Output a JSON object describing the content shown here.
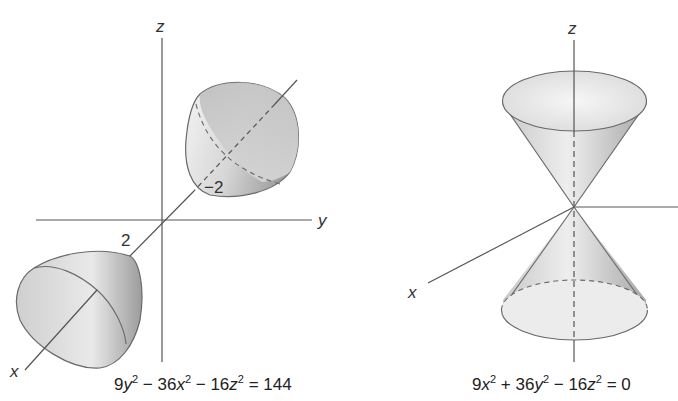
{
  "figures": [
    {
      "id": "hyperboloid-two-sheets",
      "axis_labels": {
        "x": "x",
        "y": "y",
        "z": "z"
      },
      "tick_labels": {
        "positive_x": "2",
        "negative_x": "−2"
      },
      "equation": {
        "parts": [
          "9",
          "y",
          "2",
          " − 36",
          "x",
          "2",
          " − 16",
          "z",
          "2",
          " = 144"
        ]
      }
    },
    {
      "id": "elliptic-cone",
      "axis_labels": {
        "x": "x",
        "z": "z"
      },
      "equation": {
        "parts": [
          "9",
          "x",
          "2",
          " + 36",
          "y",
          "2",
          " − 16",
          "z",
          "2",
          " = 0"
        ]
      }
    }
  ],
  "colors": {
    "axis": "#444444",
    "surface_edge": "#666666",
    "surface_light": "#f2f2f2",
    "surface_dark": "#a9a9a9"
  }
}
